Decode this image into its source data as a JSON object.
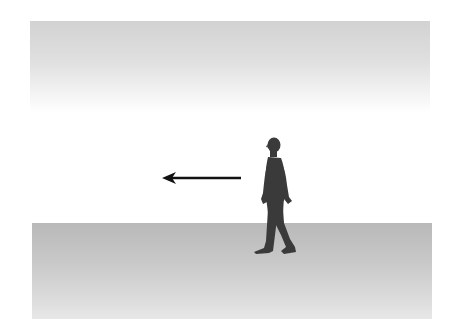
{
  "figure": {
    "direction": "left",
    "elements": {
      "sky_band": {
        "name": "upper-gradient-band",
        "color_top": "#d2d2d2",
        "color_bottom": "#ffffff"
      },
      "ground_band": {
        "name": "ground-plane",
        "color_top": "#b9b9b9",
        "color_bottom": "#e8e8e8"
      },
      "arrow": {
        "name": "motion-arrow",
        "color": "#111111",
        "points": "left"
      },
      "person": {
        "name": "walking-person-silhouette",
        "color": "#3a3a3a"
      }
    }
  },
  "colors": {
    "background": "#ffffff",
    "silhouette": "#3a3a3a",
    "arrow": "#111111"
  }
}
